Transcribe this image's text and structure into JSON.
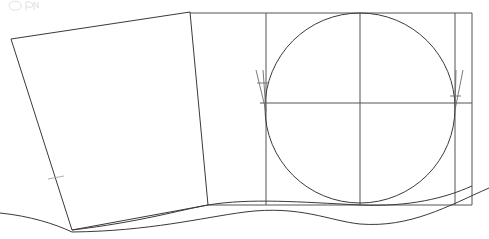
{
  "canvas": {
    "width": 489,
    "height": 239,
    "background": "#ffffff",
    "title": "Technical line drawing: rotated quadrilateral panel with gridded circle construction"
  },
  "style": {
    "line_color": "#3a3a3a",
    "grid_color": "#555555",
    "thin_color": "#6b6b6b",
    "faint_color": "#9a9a9a",
    "ghost_color": "#d8d8d8",
    "line_width": 1
  },
  "shapes": {
    "rotated_panel": {
      "name": "rotated-quadrilateral",
      "points": "11,39 190,12 208,205 72,230",
      "closed": true
    },
    "panel_left_edge_tick": {
      "name": "edge-tick-mark",
      "path": "M 48,179 L 64,176"
    },
    "grid_frame": {
      "name": "rectangular-grid-frame",
      "x": 190,
      "y": 13,
      "width": 282,
      "height": 192,
      "top_line": "M 190,13 L 472,13",
      "bottom_line": "M 208,205 L 472,205",
      "right_line": "M 472,13 L 472,205"
    },
    "vertical_rules": [
      {
        "name": "vertical-rule-1",
        "path": "M 266,13 L 266,205"
      },
      {
        "name": "vertical-rule-2",
        "path": "M 360,13 L 360,205"
      },
      {
        "name": "vertical-rule-3",
        "path": "M 455,13 L 455,205"
      }
    ],
    "horizontal_center_rule": {
      "name": "horizontal-center-rule",
      "path": "M 260,103 L 472,103"
    },
    "circle": {
      "name": "construction-circle",
      "cx": 360,
      "cy": 108,
      "r": 95
    },
    "left_tangent_marker": {
      "name": "left-tangent-tick",
      "spine": "M 256,70 L 266,111",
      "cross": "M 257,83 L 268,83",
      "stem": "M 263,70 L 266,111"
    },
    "right_tangent_marker": {
      "name": "right-tangent-tick",
      "spine": "M 463,70 L 455,110",
      "cross": "M 450,96 L 461,96",
      "stem": "M 456,70 L 455,110"
    },
    "wave_upper": {
      "name": "wave-curve-upper",
      "path": "M 72,230 C 140,222 180,210 208,205 C 250,198 300,202 360,205 C 410,207 445,198 472,186"
    },
    "wave_lower": {
      "name": "wave-curve-lower",
      "path": "M 72,232 C 150,231 200,218 245,212 C 300,205 330,221 360,224 C 410,228 448,206 489,188"
    },
    "wave_tail_left": {
      "name": "wave-curve-left-tail",
      "path": "M 0,213 C 30,216 55,224 72,232"
    },
    "faint_marks": [
      {
        "name": "faint-glyph-a",
        "path": "M 10,3 C 14,0 20,1 21,5 C 22,9 17,11 13,10 C 10,9 8,6 10,3"
      },
      {
        "name": "faint-glyph-b",
        "path": "M 26,2 L 26,11"
      },
      {
        "name": "faint-glyph-c",
        "path": "M 26,2 C 31,1 34,4 32,7 L 26,7"
      },
      {
        "name": "faint-glyph-d",
        "path": "M 34,10 L 34,2 L 38,8 L 38,2"
      }
    ]
  },
  "labels": {
    "figure_caption": "",
    "annotations": []
  }
}
